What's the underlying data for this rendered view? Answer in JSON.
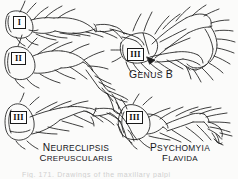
{
  "plate": {
    "background_color": "#fbfbfa",
    "ink_color": "#1a1a1a",
    "footer_text": "Fig. 171.   Drawings of the maxillary palpi"
  },
  "figures": [
    {
      "id": "fig-neureclipsis-I",
      "segment_label": "I",
      "position": "upper-left"
    },
    {
      "id": "fig-neureclipsis-II",
      "segment_label": "II",
      "position": "middle-left"
    },
    {
      "id": "fig-neureclipsis-III",
      "segment_label": "III",
      "position": "lower-left",
      "caption_line1": "NEURECLIPSIS",
      "caption_line2": "CREPUSCULARIS"
    },
    {
      "id": "fig-genus-b",
      "segment_label": "III",
      "position": "upper-right",
      "caption_line1": "GENUS B"
    },
    {
      "id": "fig-psychomyia",
      "segment_label": "III",
      "position": "lower-right",
      "caption_line1": "PSYCHOMYIA",
      "caption_line2": "FLAVIDA"
    }
  ],
  "labels": {
    "numeral_I": "I",
    "numeral_II": "II",
    "numeral_III": "III",
    "numeral_III_b": "III",
    "numeral_III_c": "III",
    "neureclipsis_line1_drop": "N",
    "neureclipsis_line1_rest": "EURECLIPSIS",
    "neureclipsis_line2_drop": "C",
    "neureclipsis_line2_rest": "REPUSCULARIS",
    "psychomyia_line1_drop": "P",
    "psychomyia_line1_rest": "SYCHOMYIA",
    "psychomyia_line2_drop": "F",
    "psychomyia_line2_rest": "LAVIDA",
    "genusb_drop1": "G",
    "genusb_rest1": "ENUS ",
    "genusb_drop2": "B"
  }
}
